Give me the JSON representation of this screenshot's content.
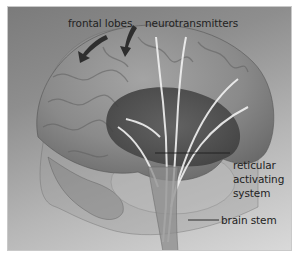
{
  "figure": {
    "colors": {
      "background_dark": "#7b7b7b",
      "background_light": "#d9d9d9",
      "brain": "#8a8a8a",
      "label_text": "#222222",
      "pathway": "#f0f0f0"
    }
  },
  "labels": {
    "frontal_lobes": "frontal lobes",
    "neurotransmitters": "neurotransmitters",
    "reticular_line1": "reticular",
    "reticular_line2": "activating",
    "reticular_line3": "system",
    "brain_stem": "brain stem"
  },
  "annotations": {
    "arrows": [
      "arrow-left-frontal",
      "arrow-right-frontal"
    ],
    "leader_lines": [
      "reticular-activating-system-line",
      "brain-stem-line"
    ]
  }
}
